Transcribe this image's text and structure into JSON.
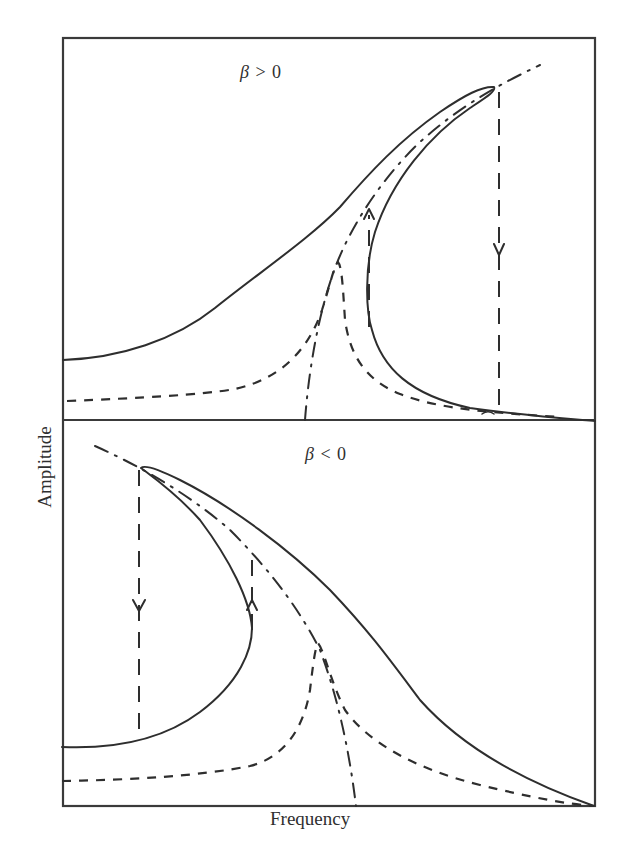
{
  "figure": {
    "x_axis_label": "Frequency",
    "y_axis_label": "Amplitude",
    "panels": [
      {
        "id": "hardening",
        "label_symbol": "β",
        "label_relation": " > 0",
        "label": "β > 0",
        "curves": [
          "nonlinear response (solid)",
          "linear response (dashed)",
          "backbone curve (dash-dot)"
        ],
        "jumps": [
          {
            "direction": "down",
            "description": "jump down from peak"
          },
          {
            "direction": "up",
            "description": "jump up at lower branch turning point"
          }
        ]
      },
      {
        "id": "softening",
        "label_symbol": "β",
        "label_relation": " < 0",
        "label": "β < 0",
        "curves": [
          "nonlinear response (solid)",
          "linear response (dashed)",
          "backbone curve (dash-dot)"
        ],
        "jumps": [
          {
            "direction": "down",
            "description": "jump down from peak"
          },
          {
            "direction": "up",
            "description": "jump up at turning point"
          }
        ]
      }
    ]
  },
  "colors": {
    "ink": "#2e2e2e",
    "background": "#ffffff"
  }
}
